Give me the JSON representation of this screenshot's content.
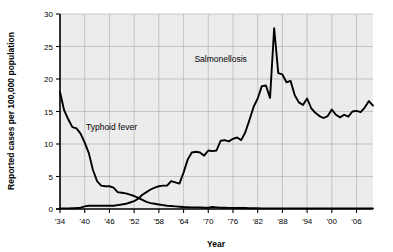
{
  "chart_data": {
    "type": "line",
    "title": "",
    "xlabel": "Year",
    "ylabel": "Reported cases per 100,000 population",
    "xlim": [
      1934,
      2010
    ],
    "ylim": [
      0,
      30
    ],
    "grid": true,
    "legend_position": "inline-annotations",
    "plot_background": "#ececec",
    "line_color": "#000000",
    "grid_color": "#b3b3b3",
    "x_ticks": [
      1934,
      1940,
      1946,
      1952,
      1958,
      1964,
      1970,
      1976,
      1982,
      1988,
      1994,
      2000,
      2006
    ],
    "x_tick_labels": [
      "'34",
      "'40",
      "'46",
      "'52",
      "'58",
      "'64",
      "'70",
      "'76",
      "'82",
      "'88",
      "'94",
      "'00",
      "'06"
    ],
    "y_ticks": [
      0,
      5,
      10,
      15,
      20,
      25,
      30
    ],
    "y_tick_labels": [
      "0",
      "5",
      "10",
      "15",
      "20",
      "25",
      "30"
    ],
    "annotations": [
      {
        "text": "Typhoid fever",
        "x": 1946.5,
        "y": 12.1
      },
      {
        "text": "Salmonellosis",
        "x": 1973.0,
        "y": 22.6
      }
    ],
    "series": [
      {
        "name": "Typhoid fever",
        "x": [
          1934,
          1935,
          1936,
          1937,
          1938,
          1939,
          1940,
          1941,
          1942,
          1943,
          1944,
          1945,
          1946,
          1947,
          1948,
          1949,
          1950,
          1951,
          1952,
          1953,
          1954,
          1955,
          1956,
          1957,
          1958,
          1959,
          1960,
          1961,
          1962,
          1963,
          1964,
          1965,
          1966,
          1967,
          1968,
          1969,
          1970,
          1971,
          1972,
          1973,
          1974,
          1975,
          1976,
          1977,
          1978,
          1979,
          1980,
          1981,
          1982,
          1983,
          1984,
          1985,
          1986,
          1987,
          1988,
          1989,
          1990,
          1991,
          1992,
          1993,
          1994,
          1995,
          1996,
          1997,
          1998,
          1999,
          2000,
          2001,
          2002,
          2003,
          2004,
          2005,
          2006,
          2007,
          2008,
          2009,
          2010
        ],
        "values": [
          18.0,
          15.2,
          13.8,
          12.6,
          12.4,
          11.6,
          10.2,
          8.6,
          6.0,
          4.3,
          3.6,
          3.5,
          3.5,
          3.3,
          2.6,
          2.5,
          2.4,
          2.2,
          2.0,
          1.7,
          1.4,
          1.1,
          0.9,
          0.8,
          0.7,
          0.6,
          0.5,
          0.45,
          0.4,
          0.35,
          0.3,
          0.28,
          0.25,
          0.25,
          0.22,
          0.2,
          0.2,
          0.3,
          0.25,
          0.2,
          0.2,
          0.18,
          0.18,
          0.15,
          0.15,
          0.15,
          0.12,
          0.12,
          0.12,
          0.1,
          0.1,
          0.1,
          0.1,
          0.1,
          0.1,
          0.1,
          0.1,
          0.1,
          0.1,
          0.1,
          0.1,
          0.1,
          0.1,
          0.1,
          0.1,
          0.1,
          0.1,
          0.1,
          0.1,
          0.1,
          0.1,
          0.1,
          0.1,
          0.1,
          0.1,
          0.1,
          0.1
        ]
      },
      {
        "name": "Salmonellosis",
        "x": [
          1934,
          1935,
          1936,
          1937,
          1938,
          1939,
          1940,
          1941,
          1942,
          1943,
          1944,
          1945,
          1946,
          1947,
          1948,
          1949,
          1950,
          1951,
          1952,
          1953,
          1954,
          1955,
          1956,
          1957,
          1958,
          1959,
          1960,
          1961,
          1962,
          1963,
          1964,
          1965,
          1966,
          1967,
          1968,
          1969,
          1970,
          1971,
          1972,
          1973,
          1974,
          1975,
          1976,
          1977,
          1978,
          1979,
          1980,
          1981,
          1982,
          1983,
          1984,
          1985,
          1986,
          1987,
          1988,
          1989,
          1990,
          1991,
          1992,
          1993,
          1994,
          1995,
          1996,
          1997,
          1998,
          1999,
          2000,
          2001,
          2002,
          2003,
          2004,
          2005,
          2006,
          2007,
          2008,
          2009,
          2010
        ],
        "values": [
          0.1,
          0.1,
          0.1,
          0.12,
          0.15,
          0.2,
          0.4,
          0.5,
          0.5,
          0.5,
          0.5,
          0.5,
          0.5,
          0.5,
          0.6,
          0.7,
          0.8,
          1.0,
          1.2,
          1.6,
          2.2,
          2.6,
          3.0,
          3.3,
          3.5,
          3.6,
          3.6,
          4.3,
          4.1,
          3.9,
          5.6,
          7.6,
          8.7,
          8.8,
          8.7,
          8.2,
          9.0,
          8.9,
          9.0,
          10.5,
          10.6,
          10.4,
          10.8,
          11.0,
          10.6,
          11.8,
          13.7,
          15.7,
          17.0,
          18.9,
          19.0,
          17.1,
          27.8,
          20.9,
          20.7,
          19.5,
          19.7,
          17.5,
          16.4,
          16.0,
          17.0,
          15.5,
          14.8,
          14.3,
          14.0,
          14.3,
          15.3,
          14.5,
          14.1,
          14.5,
          14.2,
          15.0,
          15.1,
          14.9,
          15.6,
          16.6,
          15.9
        ]
      }
    ]
  }
}
